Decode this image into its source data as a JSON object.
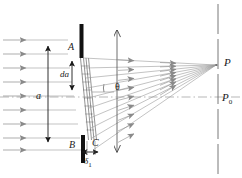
{
  "figure": {
    "width": 242,
    "height": 178,
    "background": "#ffffff",
    "ink_color": "#1a1a1a",
    "ray_color": "#8a8a8a",
    "axis_color": "#9a9a9a"
  },
  "labels": {
    "aperture_top": "A",
    "aperture_bottom": "B",
    "wavelet_point": "C",
    "slit_width": "a",
    "slit_element": "da",
    "diffraction_angle": "θ",
    "path_difference": "δ",
    "path_difference_sub": "1",
    "focus_point": "P",
    "center_point": "P",
    "center_point_sub": "0"
  },
  "elements": {
    "incoming_rays_count": 9,
    "diffracted_rays_count": 9,
    "barrier_top_label": "A",
    "barrier_bottom_label": "B",
    "screen_style": "dashed-vertical",
    "axis_style": "dash-dot-horizontal"
  }
}
